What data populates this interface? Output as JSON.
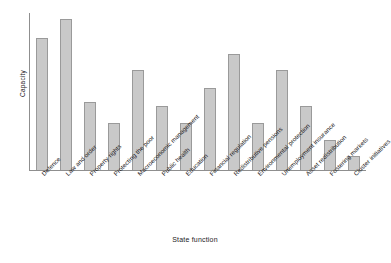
{
  "chart_data": {
    "type": "bar",
    "title": "",
    "xlabel": "State function",
    "ylabel": "Capacity",
    "grid": false,
    "legend": null,
    "ylim": [
      0,
      100
    ],
    "y_ticks_visible": false,
    "categories": [
      "Defence",
      "Law and order",
      "Property rights",
      "Protecting the poor",
      "Macroeconomic management",
      "Public health",
      "Education",
      "Financial regulation",
      "Redistributive pensions",
      "Environmental protection",
      "Unemployment insurance",
      "Asset redistribution",
      "Fostering markets",
      "Cluster initiatives"
    ],
    "values": [
      84,
      96,
      43,
      30,
      64,
      41,
      30,
      52,
      74,
      30,
      64,
      41,
      19,
      9
    ],
    "series": [
      {
        "name": "Capacity",
        "values": [
          84,
          96,
          43,
          30,
          64,
          41,
          30,
          52,
          74,
          30,
          64,
          41,
          19,
          9
        ]
      }
    ],
    "bar_fill_color": "#c9c9c9",
    "bar_border_color": "#9a9a9a",
    "axis_color": "#8f8f8f",
    "background_color": "#ffffff"
  }
}
